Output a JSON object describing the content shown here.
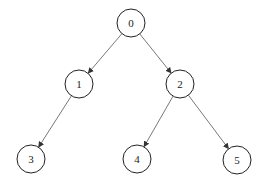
{
  "diagram": {
    "type": "binary-tree",
    "directed": true,
    "nodes": [
      {
        "id": "0",
        "label": "0"
      },
      {
        "id": "1",
        "label": "1"
      },
      {
        "id": "2",
        "label": "2"
      },
      {
        "id": "3",
        "label": "3"
      },
      {
        "id": "4",
        "label": "4"
      },
      {
        "id": "5",
        "label": "5"
      }
    ],
    "edges": [
      {
        "from": "0",
        "to": "1"
      },
      {
        "from": "0",
        "to": "2"
      },
      {
        "from": "1",
        "to": "3"
      },
      {
        "from": "2",
        "to": "4"
      },
      {
        "from": "2",
        "to": "5"
      }
    ]
  }
}
